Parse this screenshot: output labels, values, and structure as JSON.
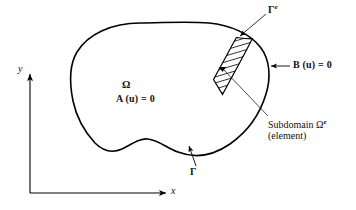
{
  "figure": {
    "background_color": "#ffffff",
    "line_color": "#000000",
    "domain_label": "Ω",
    "governing_equation": "A (u) = 0",
    "boundary_condition": "B (u) = 0",
    "boundary_label": "Γ",
    "element_boundary_label": "Γ",
    "element_boundary_sup": "e",
    "subdomain_label_text": "Subdomain Ω",
    "subdomain_label_sup": "e",
    "subdomain_sublabel": "(element)",
    "axes": {
      "x_label": "x",
      "y_label": "y"
    },
    "annotations": [
      {
        "name": "domain-symbol",
        "text": "Ω"
      },
      {
        "name": "governing-equation",
        "text": "A (u) = 0"
      },
      {
        "name": "boundary-condition",
        "text": "B (u) = 0"
      },
      {
        "name": "element-boundary",
        "text": "Γe"
      },
      {
        "name": "outer-boundary",
        "text": "Γ"
      },
      {
        "name": "subdomain-caption",
        "text": "Subdomain Ωe (element)"
      }
    ]
  },
  "icons": {
    "arrow_head": "arrow-head-icon",
    "leader_line": "leader-line-icon",
    "hatch_pattern": "diagonal-hatch-icon"
  }
}
